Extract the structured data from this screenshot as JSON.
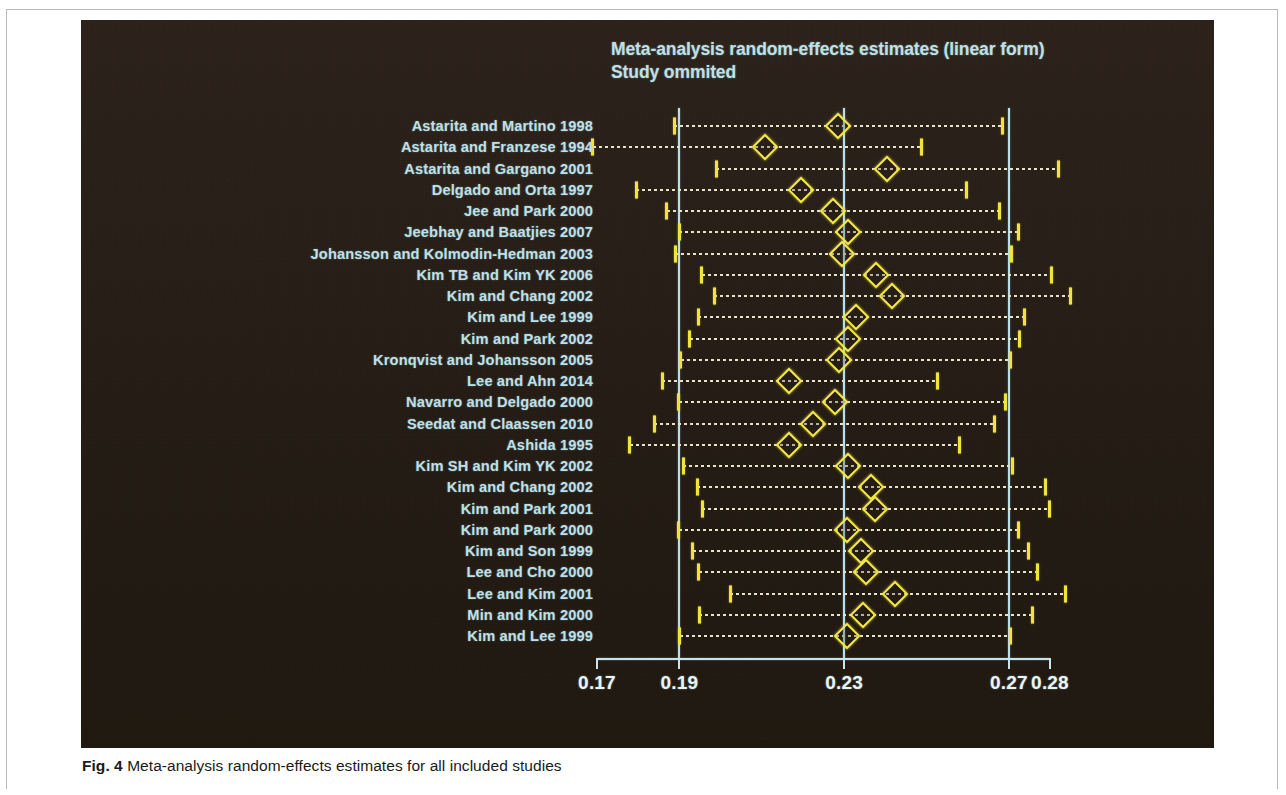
{
  "figure": {
    "caption_label": "Fig. 4",
    "caption_text": "Meta-analysis random-effects estimates for all included studies"
  },
  "colors": {
    "panel_background": "#2a2018",
    "label_text": "#bfe0e6",
    "reference_line": "#b9dfe8",
    "marker": "#f6ea46",
    "ci_line": "#e8e2c8",
    "axis": "#c8e4ec"
  },
  "chart_data": {
    "type": "scatter",
    "title": "Meta-analysis random-effects estimates (linear form)",
    "subtitle": "Study ommited",
    "xlabel": "",
    "ylabel": "",
    "xlim": [
      0.17,
      0.28
    ],
    "xticks": [
      0.17,
      0.19,
      0.23,
      0.27,
      0.28
    ],
    "xtick_labels": [
      "0.17",
      "0.19",
      "0.23",
      "0.27",
      "0.28"
    ],
    "reference_lines": [
      0.19,
      0.23,
      0.27
    ],
    "grid": false,
    "legend": null,
    "orientation": "horizontal",
    "categories": [
      "Astarita and Martino 1998",
      "Astarita and Franzese 1994",
      "Astarita and Gargano 2001",
      "Delgado and Orta  1997",
      "Jee and Park 2000",
      "Jeebhay and Baatjies 2007",
      "Johansson and Kolmodin-Hedman  2003",
      "Kim TB and Kim YK 2006",
      "Kim and Chang 2002",
      "Kim and Lee 1999",
      "Kim and Park 2002",
      "Kronqvist and Johansson 2005",
      "Lee and Ahn 2014",
      "Navarro and Delgado 2000",
      "Seedat and Claassen 2010",
      "Ashida 1995",
      "Kim SH and Kim YK 2002",
      "Kim and Chang 2002",
      "Kim and Park 2001",
      "Kim and Park 2000",
      "Kim and Son 1999",
      "Lee and Cho 2000",
      "Lee and Kim 2001",
      "Min and Kim 2000",
      "Kim and Lee 1999"
    ],
    "series": [
      {
        "name": "Random-effects estimate (study omitted)",
        "estimates": [
          0.2286,
          0.2107,
          0.2404,
          0.2196,
          0.2272,
          0.231,
          0.2295,
          0.2378,
          0.2416,
          0.2328,
          0.231,
          0.2288,
          0.2166,
          0.2278,
          0.2225,
          0.2166,
          0.231,
          0.2366,
          0.2374,
          0.2308,
          0.2341,
          0.2354,
          0.2423,
          0.2346,
          0.2308
        ],
        "ci_lower": [
          0.1888,
          0.169,
          0.199,
          0.1795,
          0.1869,
          0.19,
          0.189,
          0.1954,
          0.1985,
          0.1946,
          0.1925,
          0.1903,
          0.1859,
          0.1898,
          0.1839,
          0.178,
          0.191,
          0.1944,
          0.1955,
          0.1899,
          0.1933,
          0.1947,
          0.2024,
          0.1948,
          0.1901
        ],
        "ci_upper": [
          0.2684,
          0.2487,
          0.282,
          0.2598,
          0.2677,
          0.2723,
          0.2706,
          0.2803,
          0.2849,
          0.2739,
          0.2725,
          0.2705,
          0.2527,
          0.2691,
          0.2665,
          0.2581,
          0.2708,
          0.279,
          0.2798,
          0.2723,
          0.2747,
          0.277,
          0.2837,
          0.2758,
          0.2703
        ]
      }
    ]
  }
}
